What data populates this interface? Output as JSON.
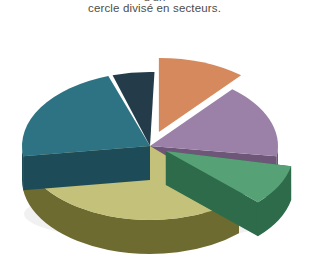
{
  "figure": {
    "background_color": "#ffffff",
    "caption": {
      "clipped_line_above": "d'un",
      "line": "cercle divisé en secteurs.",
      "color": "#4d4c48"
    }
  },
  "chart_data": {
    "type": "pie",
    "title": "",
    "subtitle": "",
    "xlabel": "",
    "ylabel": "",
    "grid": false,
    "legend": "none",
    "style": "3d-exploded-pie",
    "labels_shown": false,
    "center_x": 150,
    "center_y": 128,
    "radius_x": 128,
    "radius_y": 74,
    "depth": 34,
    "start_angle_deg": -90,
    "direction": "clockwise",
    "categories": [
      "Secteur 1",
      "Secteur 2",
      "Secteur 3",
      "Secteur 4",
      "Secteur 5",
      "Secteur 6"
    ],
    "values": [
      11,
      16,
      9,
      35,
      22,
      7
    ],
    "percentages": [
      11,
      16,
      9,
      35,
      22,
      7
    ],
    "colors": [
      "#d5895c",
      "#9b80a8",
      "#57a176",
      "#c4c17a",
      "#2e7383",
      "#243b4a"
    ],
    "side_colors": [
      "#a2603a",
      "#6e5678",
      "#2d6b4a",
      "#6e6b30",
      "#1d4c58",
      "#16262f"
    ],
    "exploded": [
      true,
      false,
      true,
      false,
      false,
      false
    ],
    "slices": [
      {
        "name": "Secteur 1",
        "value": 11,
        "percent": 11,
        "color": "#d5895c",
        "side_color": "#a2603a",
        "start_deg": -90,
        "end_deg": -50,
        "exploded": true,
        "explode_offset": 26
      },
      {
        "name": "Secteur 2",
        "value": 16,
        "percent": 16,
        "color": "#9b80a8",
        "side_color": "#6e5678",
        "start_deg": -50,
        "end_deg": 8,
        "exploded": false,
        "explode_offset": 0
      },
      {
        "name": "Secteur 3",
        "value": 9,
        "percent": 9,
        "color": "#57a176",
        "side_color": "#2d6b4a",
        "start_deg": 12,
        "end_deg": 44,
        "exploded": true,
        "explode_offset": 18
      },
      {
        "name": "Secteur 4",
        "value": 35,
        "percent": 35,
        "color": "#c4c17a",
        "side_color": "#6e6b30",
        "start_deg": 46,
        "end_deg": 172,
        "exploded": false,
        "explode_offset": 0
      },
      {
        "name": "Secteur 5",
        "value": 22,
        "percent": 22,
        "color": "#2e7383",
        "side_color": "#1d4c58",
        "start_deg": 172,
        "end_deg": 251,
        "exploded": false,
        "explode_offset": 0
      },
      {
        "name": "Secteur 6",
        "value": 7,
        "percent": 7,
        "color": "#243b4a",
        "side_color": "#16262f",
        "start_deg": 253,
        "end_deg": 272,
        "exploded": false,
        "explode_offset": 0
      }
    ]
  }
}
